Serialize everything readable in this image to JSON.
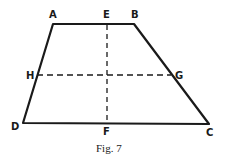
{
  "figure": {
    "caption": "Fig. 7",
    "shape": "trapezoid",
    "vertices": [
      {
        "name": "A",
        "x": 53,
        "y": 24
      },
      {
        "name": "B",
        "x": 134,
        "y": 24
      },
      {
        "name": "C",
        "x": 209,
        "y": 124
      },
      {
        "name": "D",
        "x": 23,
        "y": 123
      }
    ],
    "points": [
      {
        "name": "E",
        "x": 107,
        "y": 24
      },
      {
        "name": "F",
        "x": 107,
        "y": 123
      },
      {
        "name": "H",
        "x": 37,
        "y": 75
      },
      {
        "name": "G",
        "x": 171,
        "y": 75
      }
    ],
    "dashed_lines": [
      {
        "from": "E",
        "to": "F"
      },
      {
        "from": "H",
        "to": "G"
      }
    ],
    "labels": {
      "A": "A",
      "B": "B",
      "C": "C",
      "D": "D",
      "E": "E",
      "F": "F",
      "G": "G",
      "H": "H"
    },
    "colors": {
      "stroke": "#1a1a1a",
      "background": "#ffffff"
    }
  }
}
